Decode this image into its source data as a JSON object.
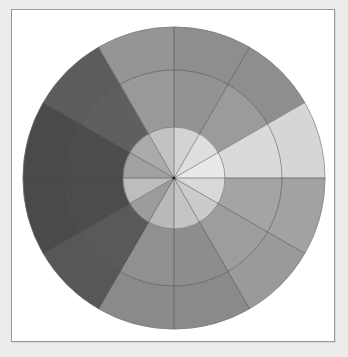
{
  "diagram": {
    "type": "segmented-wheel",
    "center": [
      174,
      178
    ],
    "radii": {
      "outer": 151,
      "middle": 108,
      "inner": 51
    },
    "segment_count": 12,
    "segment_angle_deg": 30,
    "start_angle_deg": 0,
    "direction": "clockwise-from-top",
    "grid_line_color": "#4a4a4a",
    "segments": [
      {
        "index": 1,
        "outer": "#8e8e8e",
        "middle": "#939393",
        "inner": "#d3d3d3"
      },
      {
        "index": 2,
        "outer": "#8e8e8e",
        "middle": "#9b9b9b",
        "inner": "#dedede"
      },
      {
        "index": 3,
        "outer": "#d6d6d6",
        "middle": "#dadada",
        "inner": "#e9e9e9"
      },
      {
        "index": 4,
        "outer": "#a2a2a2",
        "middle": "#a4a4a4",
        "inner": "#d9d9d9"
      },
      {
        "index": 5,
        "outer": "#9a9a9a",
        "middle": "#9d9d9d",
        "inner": "#cbcbcb"
      },
      {
        "index": 6,
        "outer": "#8a8a8a",
        "middle": "#8d8d8d",
        "inner": "#c4c4c4"
      },
      {
        "index": 7,
        "outer": "#8a8a8a",
        "middle": "#909090",
        "inner": "#b9b9b9"
      },
      {
        "index": 8,
        "outer": "#575757",
        "middle": "#595959",
        "inner": "#9c9c9c"
      },
      {
        "index": 9,
        "outer": "#4a4a4a",
        "middle": "#4c4c4c",
        "inner": "#bdbdbd"
      },
      {
        "index": 10,
        "outer": "#4a4a4a",
        "middle": "#4c4c4c",
        "inner": "#a1a1a1"
      },
      {
        "index": 11,
        "outer": "#5c5c5c",
        "middle": "#5f5f5f",
        "inner": "#aaaaaa"
      },
      {
        "index": 12,
        "outer": "#959595",
        "middle": "#999999",
        "inner": "#c2c2c2"
      }
    ]
  }
}
